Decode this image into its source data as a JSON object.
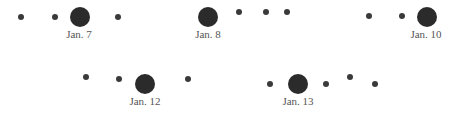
{
  "groups": [
    {
      "label": "Jan. 7",
      "big": {
        "x": 80,
        "y": 17
      },
      "label_pos": {
        "x": 79,
        "y": 28
      },
      "small": [
        {
          "x": 21,
          "y": 17
        },
        {
          "x": 55,
          "y": 17
        },
        {
          "x": 118,
          "y": 17
        }
      ]
    },
    {
      "label": "Jan. 8",
      "big": {
        "x": 208,
        "y": 17
      },
      "label_pos": {
        "x": 208,
        "y": 28
      },
      "small": [
        {
          "x": 239,
          "y": 12
        },
        {
          "x": 266,
          "y": 12
        },
        {
          "x": 287,
          "y": 12
        }
      ]
    },
    {
      "label": "Jan. 10",
      "big": {
        "x": 427,
        "y": 17
      },
      "label_pos": {
        "x": 426,
        "y": 28
      },
      "small": [
        {
          "x": 369,
          "y": 16
        },
        {
          "x": 402,
          "y": 16
        }
      ]
    },
    {
      "label": "Jan. 12",
      "big": {
        "x": 145,
        "y": 84
      },
      "label_pos": {
        "x": 145,
        "y": 95
      },
      "small": [
        {
          "x": 86,
          "y": 77
        },
        {
          "x": 119,
          "y": 79
        },
        {
          "x": 188,
          "y": 79
        }
      ]
    },
    {
      "label": "Jan. 13",
      "big": {
        "x": 298,
        "y": 84
      },
      "label_pos": {
        "x": 298,
        "y": 95
      },
      "small": [
        {
          "x": 270,
          "y": 84
        },
        {
          "x": 326,
          "y": 84
        },
        {
          "x": 350,
          "y": 77
        },
        {
          "x": 375,
          "y": 84
        }
      ]
    }
  ]
}
